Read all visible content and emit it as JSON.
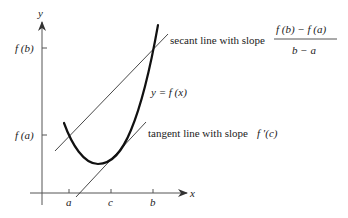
{
  "diagram": {
    "axes": {
      "x_label": "x",
      "y_label": "y"
    },
    "x_ticks": [
      {
        "id": "a",
        "label": "a"
      },
      {
        "id": "c",
        "label": "c"
      },
      {
        "id": "b",
        "label": "b"
      }
    ],
    "y_ticks": [
      {
        "id": "fb",
        "label": "f (b)"
      },
      {
        "id": "fa",
        "label": "f (a)"
      }
    ],
    "curve_label": "y = f (x)",
    "secant": {
      "label": "secant line with slope",
      "numerator": "f (b) − f (a)",
      "denominator": "b − a"
    },
    "tangent": {
      "label": "tangent line with slope",
      "slope": "f ′(c)"
    }
  }
}
